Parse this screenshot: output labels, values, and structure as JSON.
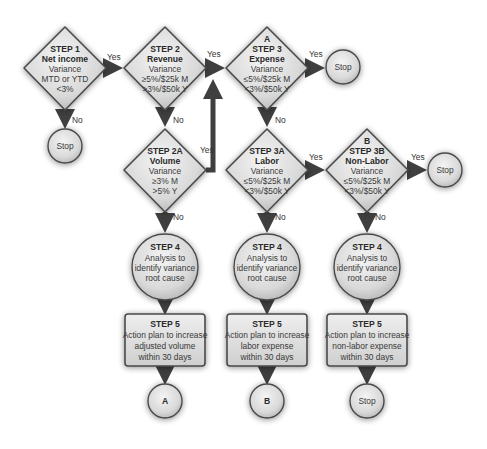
{
  "diagram": {
    "colors": {
      "fill_light": "#eeeeee",
      "fill_dark": "#bdbdbd",
      "stroke": "#4a4a4a",
      "arrow": "#3f3f3f"
    },
    "nodes": {
      "step1": {
        "lines": [
          "STEP 1",
          "Net income",
          "Variance",
          "MTD or YTD",
          "<3%"
        ]
      },
      "step2": {
        "lines": [
          "STEP 2",
          "Revenue",
          "Variance",
          "≥5%/$25k M",
          ">3%/$50k Y"
        ]
      },
      "step3": {
        "lines": [
          "A",
          "STEP 3",
          "Expense",
          "Variance",
          "≤5%/$25k M",
          "<3%/$50k Y"
        ]
      },
      "step2a": {
        "lines": [
          "STEP 2A",
          "Volume",
          "Variance",
          "≥3% M",
          ">5% Y"
        ]
      },
      "step3a": {
        "lines": [
          "STEP 3A",
          "Labor",
          "Variance",
          "≤5%/$25k M",
          "<3%/$50k Y"
        ]
      },
      "step3b": {
        "lines": [
          "B",
          "STEP 3B",
          "Non-Labor",
          "Variance",
          "≤5%/$25k M",
          "<3%/$50k Y"
        ]
      },
      "step4a": {
        "lines": [
          "STEP 4",
          "Analysis to",
          "identify variance",
          "root cause"
        ]
      },
      "step4b": {
        "lines": [
          "STEP 4",
          "Analysis to",
          "identify variance",
          "root cause"
        ]
      },
      "step4c": {
        "lines": [
          "STEP 4",
          "Analysis to",
          "identify variance",
          "root cause"
        ]
      },
      "step5a": {
        "lines": [
          "STEP 5",
          "Action plan to increase",
          "adjusted volume",
          "within 30 days"
        ]
      },
      "step5b": {
        "lines": [
          "STEP 5",
          "Action plan to increase",
          "labor expense",
          "within 30 days"
        ]
      },
      "step5c": {
        "lines": [
          "STEP 5",
          "Action plan to increase",
          "non-labor expense",
          "within 30 days"
        ]
      },
      "stop1": {
        "label": "Stop"
      },
      "stop2": {
        "label": "Stop"
      },
      "stop3": {
        "label": "Stop"
      },
      "stop4": {
        "label": "Stop"
      },
      "connA": {
        "label": "A"
      },
      "connB": {
        "label": "B"
      }
    },
    "edges": {
      "yes": "Yes",
      "no": "No"
    }
  }
}
